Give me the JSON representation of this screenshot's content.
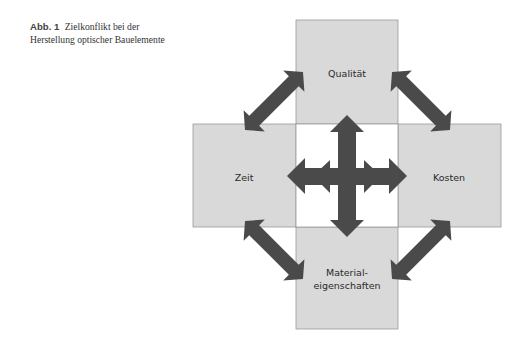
{
  "caption": {
    "label": "Abb. 1",
    "text": "Zielkonflikt bei der Herstellung optischer Bauelemente"
  },
  "diagram": {
    "nodes": {
      "top": {
        "label": "Qualität"
      },
      "left": {
        "label": "Zeit"
      },
      "right": {
        "label": "Kosten"
      },
      "bottom": {
        "label_line1": "Material-",
        "label_line2": "eigenschaften"
      }
    },
    "colors": {
      "box_fill": "#d9d9d9",
      "box_stroke": "#9a9a9a",
      "arrow": "#4a4a4a"
    }
  }
}
